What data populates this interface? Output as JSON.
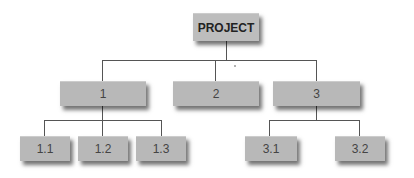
{
  "diagram": {
    "type": "work-breakdown-structure",
    "root": {
      "label": "PROJECT"
    },
    "level1": [
      {
        "label": "1"
      },
      {
        "label": "2"
      },
      {
        "label": "3"
      }
    ],
    "level2": {
      "node1": [
        {
          "label": "1.1"
        },
        {
          "label": "1.2"
        },
        {
          "label": "1.3"
        }
      ],
      "node3": [
        {
          "label": "3.1"
        },
        {
          "label": "3.2"
        }
      ]
    },
    "colors": {
      "box": "#b8b8b8",
      "line": "#555555",
      "text": "#444444"
    }
  }
}
